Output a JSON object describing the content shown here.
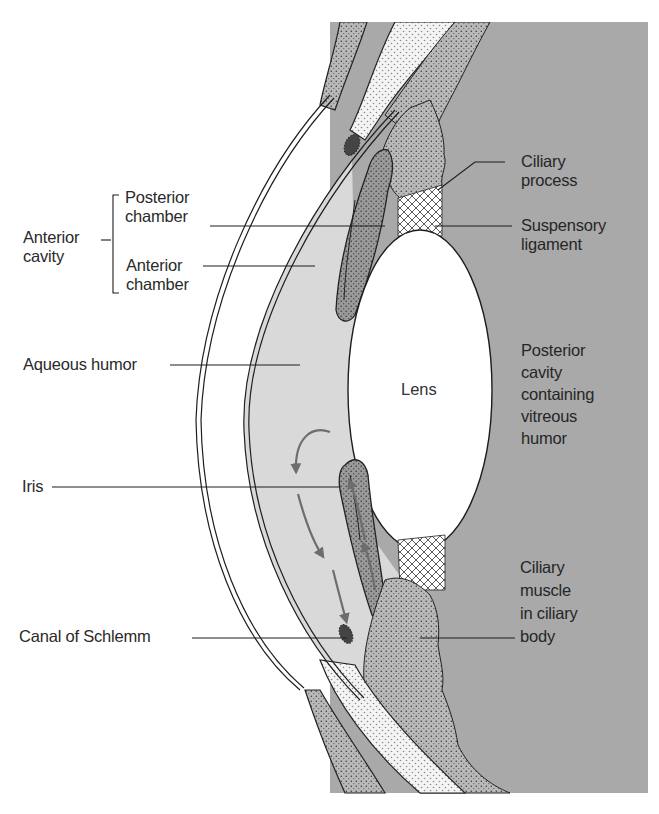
{
  "figure": {
    "type": "anatomical cross-section",
    "colors": {
      "background": "#ffffff",
      "posterior_cavity": "#a9a9a9",
      "aqueous": "#d9d9d9",
      "tissue_dark": "#8a8a8a",
      "tissue_mid": "#b5b5b5",
      "line": "#1e1e1e",
      "arrow": "#6d6d6d"
    }
  },
  "labels": {
    "left": {
      "anterior_cavity": "Anterior\ncavity",
      "posterior_chamber": "Posterior\nchamber",
      "anterior_chamber": "Anterior\nchamber",
      "aqueous_humor": "Aqueous humor",
      "iris": "Iris",
      "canal_of_schlemm": "Canal of Schlemm"
    },
    "right": {
      "ciliary_process": "Ciliary\nprocess",
      "suspensory_ligament": "Suspensory\nligament",
      "posterior_cavity": "Posterior\ncavity\ncontaining\nvitreous\nhumor",
      "ciliary_muscle": "Ciliary\nmuscle\nin ciliary\nbody"
    },
    "center": {
      "lens": "Lens"
    }
  },
  "annotations": {
    "flow_arrows": "Circulation of aqueous humor from ciliary body through posterior chamber, around iris, into anterior chamber and out via canal of Schlemm"
  }
}
